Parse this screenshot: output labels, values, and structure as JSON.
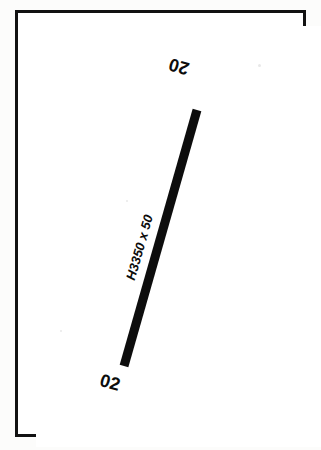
{
  "document": {
    "type": "airport-runway-diagram",
    "description": "Scanned airport sketch showing a single runway with end designators and dimensions"
  },
  "frame": {
    "border_color": "#121212",
    "fill_color": "#ffffff"
  },
  "runway": {
    "color": "#0d0d0d",
    "designation": "02/20",
    "dimension_label": "H3350 x 50",
    "length_ft": 3350,
    "width_ft": 50,
    "surface_prefix": "H",
    "end_labels": [
      {
        "name": "north-end",
        "text": "20",
        "rotation_deg": 196
      },
      {
        "name": "south-end",
        "text": "02",
        "rotation_deg": 16
      }
    ],
    "geometry": {
      "x1": 124,
      "y1": 366,
      "x2": 197,
      "y2": 110,
      "stroke_width": 9
    }
  }
}
